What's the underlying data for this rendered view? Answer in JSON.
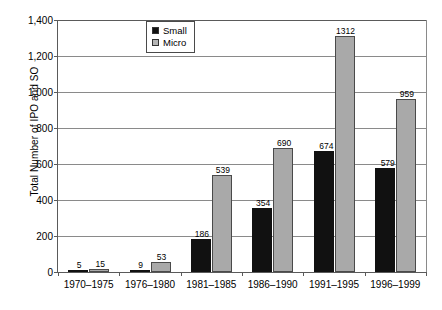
{
  "chart_data": {
    "type": "bar",
    "title": "",
    "xlabel": "",
    "ylabel": "Total Number of IPO and SO",
    "ylim": [
      0,
      1400
    ],
    "yticks": [
      0,
      200,
      400,
      600,
      800,
      1000,
      1200,
      1400
    ],
    "ytick_labels": [
      "0",
      "200",
      "400",
      "600",
      "800",
      "1,000",
      "1,200",
      "1,400"
    ],
    "grid": true,
    "legend_position": "top-center",
    "categories": [
      "1970–1975",
      "1976–1980",
      "1981–1985",
      "1986–1990",
      "1991–1995",
      "1996–1999"
    ],
    "series": [
      {
        "name": "Small",
        "color": "#111111",
        "values": [
          5,
          9,
          186,
          354,
          674,
          579
        ],
        "labels": [
          "5",
          "9",
          "186",
          "354",
          "674",
          "579"
        ]
      },
      {
        "name": "Micro",
        "color": "#a9a9a9",
        "values": [
          15,
          53,
          539,
          690,
          1312,
          959
        ],
        "labels": [
          "15",
          "53",
          "539",
          "690",
          "1312",
          "959"
        ]
      }
    ]
  },
  "legend": {
    "items": [
      {
        "label": "Small",
        "swatch": "legend-swatch-small"
      },
      {
        "label": "Micro",
        "swatch": "legend-swatch-micro"
      }
    ]
  }
}
